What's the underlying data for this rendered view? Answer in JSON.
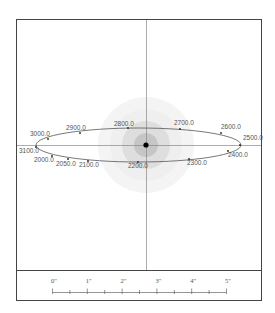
{
  "diagram": {
    "center_star": {
      "label": "",
      "color": "#000000"
    },
    "orbit_labels": [
      {
        "text": "2500.0",
        "x": 243,
        "y": 140,
        "px": 240,
        "py": 145
      },
      {
        "text": "2600.0",
        "x": 221,
        "y": 129,
        "px": 221,
        "py": 133
      },
      {
        "text": "2700.0",
        "x": 174,
        "y": 125,
        "px": 180,
        "py": 129
      },
      {
        "text": "2800.0",
        "x": 114,
        "y": 126,
        "px": 128,
        "py": 128
      },
      {
        "text": "2900.0",
        "x": 66,
        "y": 130,
        "px": 80,
        "py": 133
      },
      {
        "text": "3000.0",
        "x": 30,
        "y": 136,
        "px": 48,
        "py": 139
      },
      {
        "text": "3100.0",
        "x": 19,
        "y": 153,
        "px": 36,
        "py": 147
      },
      {
        "text": "2000.0",
        "x": 34,
        "y": 162,
        "px": 52,
        "py": 156
      },
      {
        "text": "2050.0",
        "x": 56,
        "y": 166,
        "px": 68,
        "py": 159
      },
      {
        "text": "2100.0",
        "x": 79,
        "y": 167,
        "px": 88,
        "py": 161
      },
      {
        "text": "2200.0",
        "x": 128,
        "y": 168,
        "px": 138,
        "py": 162
      },
      {
        "text": "2300.0",
        "x": 187,
        "y": 165,
        "px": 189,
        "py": 159
      },
      {
        "text": "2400.0",
        "x": 228,
        "y": 157,
        "px": 228,
        "py": 151
      }
    ],
    "scale": {
      "labels": [
        "0\"",
        "1\"",
        "2\"",
        "3\"",
        "4\"",
        "5\""
      ]
    }
  }
}
